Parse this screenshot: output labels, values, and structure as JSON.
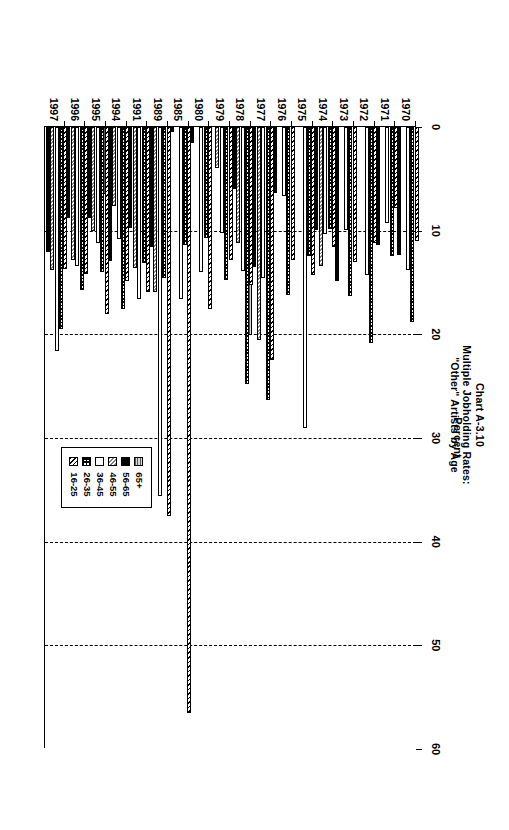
{
  "title": {
    "line1": "Chart A-3.10",
    "line2": "Multiple Jobholding Rates:",
    "line3": "\"Other\" Artists by Age"
  },
  "chart_data": {
    "type": "bar",
    "orientation": "horizontal",
    "title": "Chart A-3.10 Multiple Jobholding Rates: \"Other\" Artists by Age",
    "xlabel": "Percent",
    "ylabel": "",
    "xlim": [
      0,
      60
    ],
    "xticks": [
      0,
      10,
      20,
      30,
      40,
      50,
      60
    ],
    "grid": "dashed vertical gridlines at 10,20,30,40,50",
    "legend_position": "bottom-right",
    "categories": [
      "1970",
      "1971",
      "1972",
      "1973",
      "1974",
      "1975",
      "1976",
      "1977",
      "1978",
      "1979",
      "1980",
      "1985",
      "1989",
      "1991",
      "1994",
      "1995",
      "1996",
      "1997"
    ],
    "series": [
      {
        "name": "16-25",
        "values": [
          11.0,
          7.8,
          11.2,
          13.0,
          11.6,
          14.3,
          12.8,
          22.5,
          15.2,
          12.8,
          17.6,
          56.5,
          37.5,
          15.9,
          14.9,
          18.0,
          14.2,
          13.7
        ]
      },
      {
        "name": "26-35",
        "values": [
          18.8,
          12.4,
          20.8,
          16.3,
          9.8,
          12.4,
          16.2,
          26.3,
          24.8,
          14.8,
          10.7,
          11.4,
          14.6,
          13.1,
          17.6,
          14.0,
          15.7,
          19.5
        ]
      },
      {
        "name": "36-45",
        "values": [
          13.8,
          9.3,
          14.3,
          9.9,
          10.3,
          29.0,
          6.7,
          14.6,
          13.9,
          10.2,
          14.0,
          16.6,
          35.6,
          16.6,
          10.8,
          11.2,
          13.4,
          21.6
        ]
      },
      {
        "name": "46-55",
        "values": [
          0.0,
          0.0,
          0.0,
          0.0,
          13.4,
          0.0,
          0.0,
          20.5,
          11.2,
          4.0,
          0.0,
          0.0,
          15.9,
          13.6,
          7.6,
          10.0,
          12.8,
          13.8
        ]
      },
      {
        "name": "56-65",
        "values": [
          12.3,
          11.4,
          0.0,
          14.9,
          9.9,
          0.0,
          6.4,
          13.5,
          6.0,
          0.0,
          1.5,
          0.5,
          11.6,
          9.7,
          12.9,
          8.8,
          8.8,
          12.1
        ]
      },
      {
        "name": "65+",
        "values": [
          0.0,
          0.0,
          0.0,
          0.0,
          0.0,
          0.0,
          0.0,
          20.1,
          0.0,
          0.0,
          0.0,
          0.0,
          10.0,
          7.6,
          6.5,
          7.6,
          7.0,
          0.0
        ]
      }
    ]
  },
  "legend": {
    "entries": [
      {
        "label": "16-25",
        "pattern": "dense-diagonal-hatch"
      },
      {
        "label": "26-35",
        "pattern": "checker-dots"
      },
      {
        "label": "36-45",
        "pattern": "white"
      },
      {
        "label": "46-55",
        "pattern": "grey-diagonal-stipple"
      },
      {
        "label": "56-65",
        "pattern": "solid-black"
      },
      {
        "label": "65+",
        "pattern": "grey-horizontal-stipple"
      }
    ]
  },
  "axis": {
    "value_axis_title": "Percent",
    "value_ticks": [
      "0",
      "10",
      "20",
      "30",
      "40",
      "50",
      "60"
    ]
  }
}
